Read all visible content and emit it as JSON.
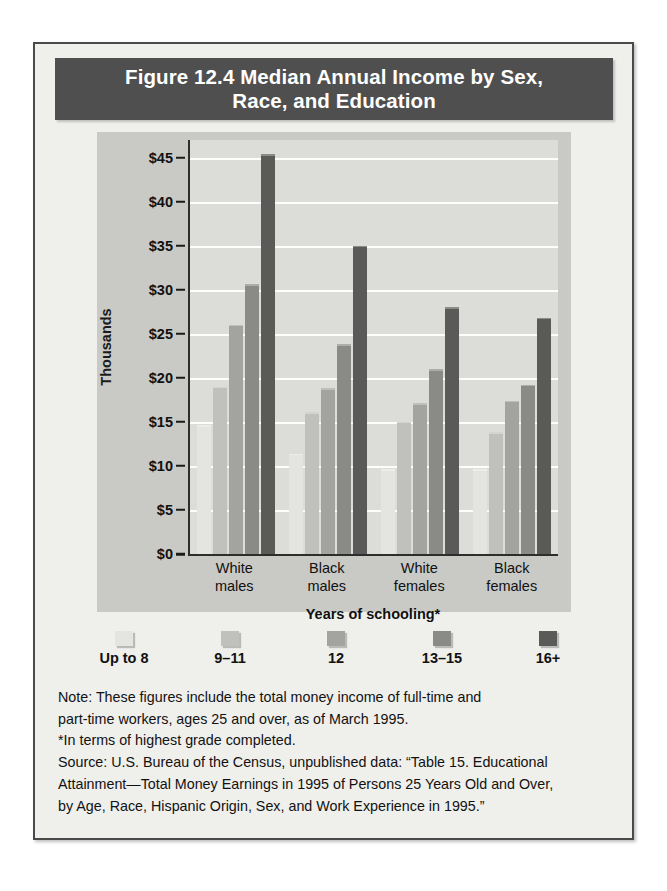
{
  "figure": {
    "title": "Figure 12.4  Median Annual Income by Sex, Race, and Education",
    "title_line1": "Figure 12.4  Median Annual Income by Sex,",
    "title_line2": "Race, and Education",
    "ylabel": "Thousands",
    "xlabel": "Years of schooling*"
  },
  "notes": {
    "note_line1": "Note: These figures include the total money income of full-time and",
    "note_line2": "part-time workers, ages 25 and over, as of March 1995.",
    "footnote": "*In terms of highest grade completed.",
    "source_line1": "Source: U.S. Bureau of the Census, unpublished data: “Table 15. Educational",
    "source_line2": "Attainment—Total Money Earnings in 1995 of Persons 25 Years Old and Over,",
    "source_line3": "by Age, Race, Hispanic Origin, Sex, and Work Experience in 1995.”"
  },
  "colors": {
    "series": [
      "#e4e4e0",
      "#c0c0bc",
      "#a3a3a0",
      "#8a8a87",
      "#5a5a58"
    ],
    "panel": "#c9c9c5",
    "plot_bg": "#dcdcd8",
    "title_bar": "#4f4f4f",
    "page_bg": "#efefec",
    "gridline": "#fdfdfb",
    "axis": "#2d2d2d"
  },
  "chart_data": {
    "type": "bar",
    "title": "Figure 12.4  Median Annual Income by Sex, Race, and Education",
    "xlabel": "Years of schooling*",
    "ylabel": "Thousands",
    "ylim": [
      0,
      47
    ],
    "yticks": [
      0,
      5,
      10,
      15,
      20,
      25,
      30,
      35,
      40,
      45
    ],
    "ytick_labels": [
      "$0",
      "$5",
      "$10",
      "$15",
      "$20",
      "$25",
      "$30",
      "$35",
      "$40",
      "$45"
    ],
    "grid": true,
    "legend_position": "bottom",
    "categories": [
      "White males",
      "Black males",
      "White females",
      "Black females"
    ],
    "category_lines": [
      [
        "White",
        "males"
      ],
      [
        "Black",
        "males"
      ],
      [
        "White",
        "females"
      ],
      [
        "Black",
        "females"
      ]
    ],
    "series": [
      {
        "name": "Up to 8",
        "values": [
          14.6,
          11.4,
          9.6,
          9.6
        ]
      },
      {
        "name": "9–11",
        "values": [
          19.0,
          16.1,
          15.0,
          13.8
        ]
      },
      {
        "name": "12",
        "values": [
          26.0,
          18.8,
          17.1,
          17.4
        ]
      },
      {
        "name": "13–15",
        "values": [
          30.6,
          23.8,
          21.0,
          19.2
        ]
      },
      {
        "name": "16+",
        "values": [
          45.4,
          35.0,
          28.0,
          26.8
        ]
      }
    ]
  }
}
